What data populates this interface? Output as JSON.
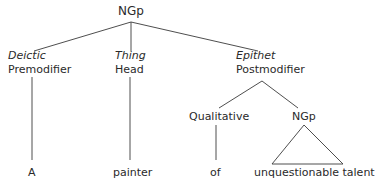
{
  "tree": {
    "root": {
      "label": "NGp"
    },
    "branches": [
      {
        "function": "Deictic",
        "role": "Premodifier",
        "leaf": "A"
      },
      {
        "function": "Thing",
        "role": "Head",
        "leaf": "painter"
      },
      {
        "function": "Epithet",
        "role": "Postmodifier",
        "children": [
          {
            "label": "Qualitative",
            "leaf": "of"
          },
          {
            "label": "NGp",
            "leaf": "unquestionable talent",
            "collapsed": true
          }
        ]
      }
    ]
  },
  "colors": {
    "line": "#3a3a3a",
    "text": "#2a2a2a",
    "background": "#ffffff"
  }
}
